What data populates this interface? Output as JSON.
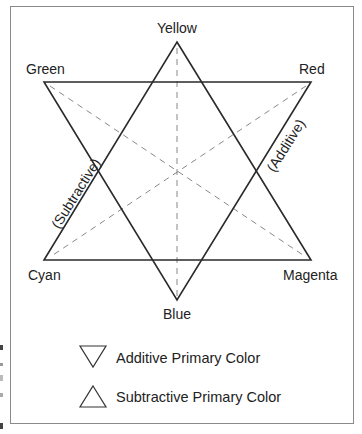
{
  "diagram": {
    "vertices": {
      "yellow": {
        "label": "Yellow",
        "type": "subtractive"
      },
      "green": {
        "label": "Green",
        "type": "additive"
      },
      "red": {
        "label": "Red",
        "type": "additive"
      },
      "cyan": {
        "label": "Cyan",
        "type": "subtractive"
      },
      "magenta": {
        "label": "Magenta",
        "type": "subtractive"
      },
      "blue": {
        "label": "Blue",
        "type": "additive"
      }
    },
    "edge_labels": {
      "additive": "(Additive)",
      "subtractive": "(Subtractive)"
    },
    "colors": {
      "line": "#2a2a2a",
      "dashed": "#888888",
      "frame": "#8a8a8a",
      "text": "#222222"
    }
  },
  "legend": {
    "items": [
      {
        "symbol": "down-triangle",
        "label": "Additive Primary Color"
      },
      {
        "symbol": "up-triangle",
        "label": "Subtractive Primary Color"
      }
    ]
  }
}
